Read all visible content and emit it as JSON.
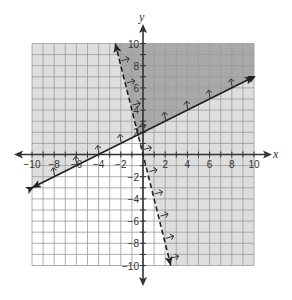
{
  "chart_data": {
    "type": "line",
    "title": "",
    "xlabel": "x",
    "ylabel": "y",
    "xlim": [
      -10,
      10
    ],
    "ylim": [
      -10,
      10
    ],
    "grid": true,
    "grid_step": 1,
    "x_ticks": [
      -10,
      -8,
      -6,
      -4,
      -2,
      2,
      4,
      6,
      8,
      10
    ],
    "y_ticks": [
      -10,
      -8,
      -6,
      -4,
      -2,
      2,
      4,
      6,
      8,
      10
    ],
    "x_tick_labels": [
      "−10",
      "−8",
      "−6",
      "−4",
      "−2",
      "2",
      "4",
      "6",
      "8",
      "10"
    ],
    "y_tick_labels": [
      "−10",
      "−8",
      "−6",
      "−4",
      "−2",
      "2",
      "4",
      "6",
      "8",
      "10"
    ],
    "series": [
      {
        "name": "solid boundary",
        "equation": "y = 0.5x + 2",
        "style": "solid",
        "x": [
          -10,
          10
        ],
        "y": [
          -3,
          7
        ],
        "shade_direction": "above"
      },
      {
        "name": "dashed boundary",
        "equation": "y = -4x",
        "style": "dashed",
        "x": [
          -2.5,
          2.5
        ],
        "y": [
          10,
          -10
        ],
        "shade_direction": "right"
      }
    ],
    "regions": [
      {
        "name": "solution (overlap)",
        "description": "above solid line and right of dashed line",
        "color": "#a9a9a9"
      },
      {
        "name": "single inequality",
        "description": "satisfies one inequality only",
        "color": "#dedede"
      },
      {
        "name": "neither",
        "description": "below solid line and left of dashed line",
        "color": "#ffffff"
      }
    ]
  },
  "colors": {
    "dark_shade": "#a9a9a9",
    "light_shade": "#dedede",
    "grid_line": "#9a9a9a",
    "axis": "#333333",
    "line": "#222222"
  },
  "labels": {
    "x_axis": "x",
    "y_axis": "y"
  }
}
